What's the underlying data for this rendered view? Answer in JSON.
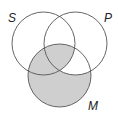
{
  "diagram": {
    "type": "venn",
    "sets": [
      {
        "label": "S",
        "cx": 43.5,
        "cy": 43.5,
        "r": 31.5
      },
      {
        "label": "P",
        "cx": 75.5,
        "cy": 43.5,
        "r": 31.5
      },
      {
        "label": "M",
        "cx": 59.5,
        "cy": 75.5,
        "r": 31.5
      }
    ],
    "shaded_regions": [
      "M only",
      "S∩M not P",
      "S∩P∩M"
    ],
    "unshaded_regions": [
      "S only",
      "P only",
      "S∩P not M",
      "P∩M not S"
    ],
    "colors": {
      "shade": "#cfcfcf",
      "stroke": "#555555"
    }
  },
  "labels": {
    "s": "S",
    "p": "P",
    "m": "M"
  }
}
